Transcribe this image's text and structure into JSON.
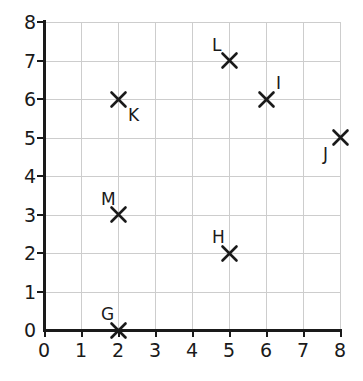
{
  "chart_data": {
    "type": "scatter",
    "title": "",
    "xlabel": "",
    "ylabel": "",
    "xlim": [
      0,
      8
    ],
    "ylim": [
      0,
      8
    ],
    "grid": true,
    "legend": "none",
    "marker_style": "x",
    "marker_color": "#1a1a1a",
    "grid_color": "#cdcdcd",
    "axis_color": "#1a1a1a",
    "x_ticks": [
      "0",
      "1",
      "2",
      "3",
      "4",
      "5",
      "6",
      "7",
      "8"
    ],
    "y_ticks": [
      "0",
      "1",
      "2",
      "3",
      "4",
      "5",
      "6",
      "7",
      "8"
    ],
    "points": [
      {
        "label": "G",
        "x": 2,
        "y": 0,
        "label_pos": "above-left"
      },
      {
        "label": "H",
        "x": 5,
        "y": 2,
        "label_pos": "above-left"
      },
      {
        "label": "I",
        "x": 6,
        "y": 6,
        "label_pos": "above-right"
      },
      {
        "label": "J",
        "x": 8,
        "y": 5,
        "label_pos": "below-left"
      },
      {
        "label": "K",
        "x": 2,
        "y": 6,
        "label_pos": "below-right"
      },
      {
        "label": "L",
        "x": 5,
        "y": 7,
        "label_pos": "above-left"
      },
      {
        "label": "M",
        "x": 2,
        "y": 3,
        "label_pos": "above-left"
      }
    ]
  }
}
